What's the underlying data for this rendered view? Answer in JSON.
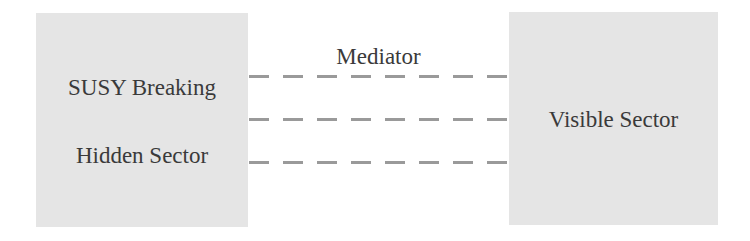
{
  "diagram": {
    "type": "block-diagram",
    "left_box": {
      "lines": [
        "SUSY Breaking",
        "Hidden Sector"
      ],
      "fill": "#e5e5e5"
    },
    "right_box": {
      "lines": [
        "Visible Sector"
      ],
      "fill": "#e5e5e5"
    },
    "connector": {
      "label": "Mediator",
      "style": "dashed",
      "count": 3,
      "color": "#9a9a9a"
    }
  }
}
